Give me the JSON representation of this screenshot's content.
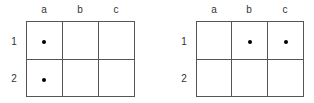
{
  "panels": [
    {
      "columns": [
        "a",
        "b",
        "c"
      ],
      "rows": [
        "1",
        "2"
      ],
      "dots": [
        {
          "row": "1",
          "col": "a"
        },
        {
          "row": "2",
          "col": "a"
        }
      ]
    },
    {
      "columns": [
        "a",
        "b",
        "c"
      ],
      "rows": [
        "1",
        "2"
      ],
      "dots": [
        {
          "row": "1",
          "col": "b"
        },
        {
          "row": "1",
          "col": "c"
        }
      ]
    }
  ],
  "colors": {
    "grid_line": "#555555",
    "dot": "#000000",
    "background": "#ffffff"
  }
}
